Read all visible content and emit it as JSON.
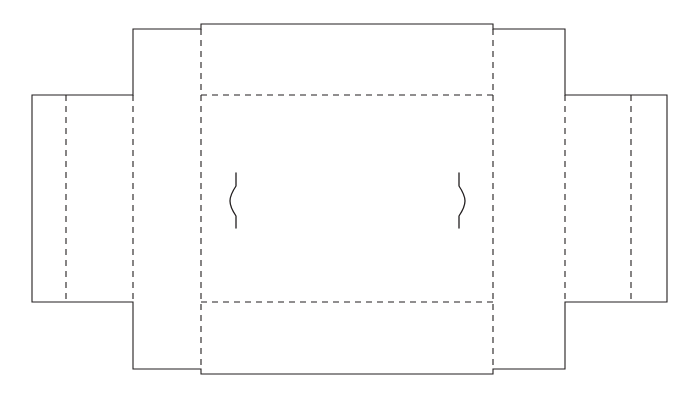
{
  "document": {
    "title": "Box Dieline Template",
    "type": "packaging-dieline",
    "description": "Flat unfolded carton die-cut layout with tuck flaps, glue flap and two curved thumb-notch slits",
    "canvas": {
      "width": 699,
      "height": 396,
      "background": "#ffffff"
    }
  },
  "style": {
    "cut_color": "#231f20",
    "fold_color": "#231f20",
    "cut_stroke_width": 1.1,
    "fold_stroke_width": 1.1,
    "fold_dash_pattern": "6 5",
    "slit_stroke_width": 1.3
  },
  "legend": {
    "cut_label": "Cut line (solid)",
    "fold_label": "Fold / score line (dashed)",
    "slit_label": "Curved slit"
  },
  "geometry": {
    "key_x": {
      "left_edge": 32,
      "left_panel_fold_1": 66,
      "left_panel_fold_2": 133,
      "body_fold_left": 201,
      "notch_left": 201,
      "slit_left": 236,
      "slit_right": 459,
      "notch_right": 493,
      "body_fold_right": 493,
      "right_panel_fold_1": 565,
      "right_panel_fold_2": 631,
      "right_edge": 667
    },
    "key_y": {
      "flap_top_high": 24,
      "flap_top": 29,
      "body_top": 95,
      "slit_top": 173,
      "slit_bottom": 228,
      "body_bottom": 302,
      "flap_bottom": 369,
      "flap_bottom_low": 374
    }
  },
  "panels": [
    {
      "name": "left-glue-flap",
      "label": "Left glue flap",
      "x": 32,
      "y": 95,
      "width": 34,
      "height": 207
    },
    {
      "name": "left-end-panel",
      "label": "Left end panel",
      "x": 66,
      "y": 95,
      "width": 67,
      "height": 207
    },
    {
      "name": "left-side-panel",
      "label": "Left side panel",
      "x": 133,
      "y": 95,
      "width": 68,
      "height": 207
    },
    {
      "name": "top-tuck-flap",
      "label": "Top tuck flap",
      "x": 133,
      "y": 29,
      "width": 432,
      "height": 66
    },
    {
      "name": "main-front-panel",
      "label": "Main front panel",
      "x": 201,
      "y": 95,
      "width": 292,
      "height": 207
    },
    {
      "name": "bottom-tuck-flap",
      "label": "Bottom tuck flap",
      "x": 133,
      "y": 302,
      "width": 432,
      "height": 67
    },
    {
      "name": "right-side-panel",
      "label": "Right side panel",
      "x": 493,
      "y": 95,
      "width": 72,
      "height": 207
    },
    {
      "name": "right-end-panel",
      "label": "Right end panel",
      "x": 565,
      "y": 95,
      "width": 66,
      "height": 207
    },
    {
      "name": "right-glue-flap",
      "label": "Right glue flap",
      "x": 631,
      "y": 95,
      "width": 36,
      "height": 207
    }
  ],
  "paths": {
    "outer_cut": "M 32 95 L 133 95 L 133 29 L 201 29 L 201 24 L 493 24 L 493 29 L 565 29 L 565 95 L 667 95 L 667 302 L 565 302 L 565 369 L 493 369 L 493 374 L 201 374 L 201 369 L 133 369 L 133 302 L 32 302 Z",
    "fold_vertical_left_1": "M 66 95 L 66 302",
    "fold_vertical_left_2": "M 133 95 L 133 302",
    "fold_vertical_body_left": "M 201 29 L 201 369",
    "fold_vertical_body_right": "M 493 29 L 493 369",
    "fold_vertical_right_1": "M 565 95 L 565 302",
    "fold_vertical_right_2": "M 631 95 L 631 302",
    "fold_horizontal_top": "M 201 95 L 493 95",
    "fold_horizontal_bottom": "M 201 302 L 493 302",
    "slit_left": "M 236 173 L 236 186 C 228 198 228 204 236 216 L 236 228",
    "slit_right": "M 459 173 L 459 186 C 467 198 467 204 459 216 L 459 228"
  }
}
